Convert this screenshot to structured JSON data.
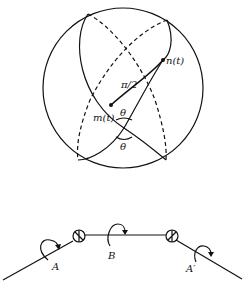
{
  "figure": {
    "sphere": {
      "labels": {
        "n": "n(t)",
        "m": "m(t)",
        "arc": "π/2",
        "theta_top": "θ",
        "theta_bottom": "θ"
      }
    },
    "chain": {
      "labels": {
        "left": "A",
        "middle": "B",
        "right": "A′"
      }
    }
  }
}
